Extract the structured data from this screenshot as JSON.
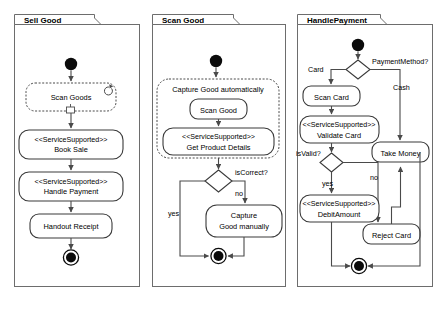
{
  "diagram": {
    "kind": "uml-activity-diagram",
    "panel_count": 3
  },
  "panels": [
    {
      "id": "sell-good",
      "title": "Sell Good",
      "nodes": [
        {
          "id": "p1-init",
          "type": "initial-node",
          "label": ""
        },
        {
          "id": "p1-scan-goods",
          "type": "action-loop",
          "label": "Scan Goods",
          "marker": "loop-icon"
        },
        {
          "id": "p1-book-sale",
          "type": "action-stereotype",
          "stereotype": "<<ServiceSupported>>",
          "label": "Book Sale"
        },
        {
          "id": "p1-handle-payment",
          "type": "action-stereotype",
          "stereotype": "<<ServiceSupported>>",
          "label": "Handle Payment"
        },
        {
          "id": "p1-handout-receipt",
          "type": "action",
          "label": "Handout Receipt"
        },
        {
          "id": "p1-final",
          "type": "final-node",
          "label": ""
        }
      ],
      "edges": []
    },
    {
      "id": "scan-good",
      "title": "Scan Good",
      "nodes": [
        {
          "id": "p2-init",
          "type": "initial-node",
          "label": ""
        },
        {
          "id": "p2-group",
          "type": "group-dashed",
          "label": "Capture Good automatically"
        },
        {
          "id": "p2-scan-good",
          "type": "action",
          "label": "Scan Good"
        },
        {
          "id": "p2-get-details",
          "type": "action-stereotype",
          "stereotype": "<<ServiceSupported>>",
          "label": "Get Product Details"
        },
        {
          "id": "p2-decision",
          "type": "decision",
          "label": "isCorrect?"
        },
        {
          "id": "p2-capture-manual",
          "type": "action",
          "label_line1": "Capture",
          "label_line2": "Good manually"
        },
        {
          "id": "p2-final",
          "type": "final-node",
          "label": ""
        }
      ],
      "edges": [
        {
          "id": "p2-edge-yes",
          "label": "yes"
        },
        {
          "id": "p2-edge-no",
          "label": "no"
        }
      ]
    },
    {
      "id": "handle-payment",
      "title": "HandlePayment",
      "nodes": [
        {
          "id": "p3-init",
          "type": "initial-node",
          "label": ""
        },
        {
          "id": "p3-decision-method",
          "type": "decision",
          "label": "PaymentMethod?"
        },
        {
          "id": "p3-scan-card",
          "type": "action",
          "label": "Scan Card"
        },
        {
          "id": "p3-validate-card",
          "type": "action-stereotype",
          "stereotype": "<<ServiceSupported>>",
          "label": "Validate Card"
        },
        {
          "id": "p3-decision-valid",
          "type": "decision",
          "label": "isValid?"
        },
        {
          "id": "p3-debit-amount",
          "type": "action-stereotype",
          "stereotype": "<<ServiceSupported>>",
          "label": "DebitAmount"
        },
        {
          "id": "p3-take-money",
          "type": "action",
          "label": "Take Money"
        },
        {
          "id": "p3-reject-card",
          "type": "action",
          "label": "Reject Card"
        },
        {
          "id": "p3-final",
          "type": "final-node",
          "label": ""
        }
      ],
      "edges": [
        {
          "id": "p3-edge-card",
          "label": "Card"
        },
        {
          "id": "p3-edge-cash",
          "label": "Cash"
        },
        {
          "id": "p3-edge-yes",
          "label": "yes"
        },
        {
          "id": "p3-edge-no",
          "label": "no"
        }
      ]
    }
  ],
  "colors": {
    "background": "#ffffff",
    "frame_stroke": "#6d6d6d",
    "node_stroke": "#3a3a3a",
    "flow_stroke": "#4a4a4a",
    "node_fill": "#ffffff",
    "text": "#000000",
    "solid_node": "#0b0b0b"
  }
}
